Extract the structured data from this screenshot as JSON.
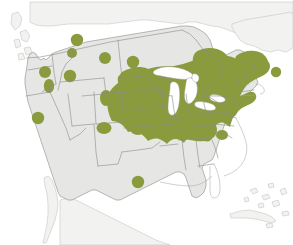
{
  "figure": {
    "kind": "species-range-map",
    "region": "North America",
    "title": "",
    "caption": "",
    "width": 293,
    "height": 245
  },
  "colors": {
    "background": "#ffffff",
    "range_green": "#8a9b3e",
    "land_us": "#e6e6e4",
    "land_other": "#ededeb",
    "land_faint": "#f2f2f0",
    "border_gray": "#8c8c8c",
    "coast_gray": "#a0a0a0",
    "lake_white": "#ffffff"
  },
  "legend": {
    "present": false,
    "items": []
  },
  "labels": {
    "present": false,
    "items": []
  },
  "chart_data": {
    "type": "map",
    "projection_note": "conic, continental United States with southern Canada, northern Mexico, Cuba and Bahamas",
    "title": "",
    "xlabel": "",
    "ylabel": "",
    "legend_position": "none",
    "grid": false,
    "series": [
      {
        "name": "Core contiguous range",
        "color": "#8a9b3e",
        "description": "Continuous shading across the Upper Midwest, Great Lakes states, Ohio Valley, Appalachians, Mid-Atlantic, New England and adjacent southeastern Canada",
        "regions": [
          "Minnesota (east)",
          "Wisconsin",
          "Michigan",
          "Iowa (northeast)",
          "Illinois (north)",
          "Indiana",
          "Ohio",
          "Kentucky (north)",
          "West Virginia",
          "Pennsylvania",
          "New York",
          "New Jersey",
          "Connecticut",
          "Rhode Island",
          "Massachusetts",
          "Vermont",
          "New Hampshire",
          "Maine",
          "Ontario (south)",
          "Quebec (south)",
          "New Brunswick",
          "Nova Scotia"
        ]
      },
      {
        "name": "Outlying occurrence dots",
        "color": "#8a9b3e",
        "description": "Isolated circular and elongated patches scattered across the western and southern United States",
        "points": [
          {
            "x": 77,
            "y": 40,
            "rx": 6.2,
            "ry": 6.2,
            "place": "south-central British Columbia / northern Washington"
          },
          {
            "x": 72,
            "y": 53,
            "rx": 5.0,
            "ry": 5.0,
            "place": "northern Idaho"
          },
          {
            "x": 105,
            "y": 58,
            "rx": 6.0,
            "ry": 6.0,
            "place": "north-central Montana"
          },
          {
            "x": 133,
            "y": 62,
            "rx": 6.2,
            "ry": 6.2,
            "place": "western North Dakota"
          },
          {
            "x": 45,
            "y": 72,
            "rx": 6.0,
            "ry": 6.0,
            "place": "central Washington"
          },
          {
            "x": 70,
            "y": 76,
            "rx": 6.2,
            "ry": 6.2,
            "place": "southwestern Montana"
          },
          {
            "x": 49,
            "y": 86,
            "rx": 5.2,
            "ry": 7.0,
            "place": "eastern Oregon"
          },
          {
            "x": 146,
            "y": 79,
            "rx": 5.4,
            "ry": 5.4,
            "place": "eastern North Dakota"
          },
          {
            "x": 106,
            "y": 98,
            "rx": 6.0,
            "ry": 8.0,
            "place": "eastern Wyoming / Black Hills"
          },
          {
            "x": 122,
            "y": 106,
            "rx": 5.4,
            "ry": 5.4,
            "place": "central Nebraska"
          },
          {
            "x": 145,
            "y": 102,
            "rx": 6.6,
            "ry": 7.5,
            "place": "eastern Nebraska"
          },
          {
            "x": 38,
            "y": 118,
            "rx": 6.2,
            "ry": 6.2,
            "place": "northern California / Sierra"
          },
          {
            "x": 104,
            "y": 128,
            "rx": 7.5,
            "ry": 6.0,
            "place": "western Kansas"
          },
          {
            "x": 138,
            "y": 129,
            "rx": 8.0,
            "ry": 6.0,
            "place": "eastern Kansas"
          },
          {
            "x": 138,
            "y": 182,
            "rx": 6.2,
            "ry": 6.2,
            "place": "north-central Texas"
          },
          {
            "x": 212,
            "y": 64,
            "rx": 6.0,
            "ry": 6.0,
            "place": "southern Ontario / Georgian Bay"
          },
          {
            "x": 247,
            "y": 58,
            "rx": 5.0,
            "ry": 5.0,
            "place": "southern Quebec"
          },
          {
            "x": 262,
            "y": 70,
            "rx": 5.0,
            "ry": 5.0,
            "place": "New Brunswick"
          },
          {
            "x": 276,
            "y": 72,
            "rx": 5.2,
            "ry": 5.2,
            "place": "Nova Scotia"
          },
          {
            "x": 223,
            "y": 110,
            "rx": 6.5,
            "ry": 5.5,
            "place": "Virginia piedmont"
          },
          {
            "x": 166,
            "y": 124,
            "rx": 6.5,
            "ry": 5.5,
            "place": "southern Missouri / Ozarks"
          },
          {
            "x": 196,
            "y": 123,
            "rx": 6.0,
            "ry": 5.5,
            "place": "Tennessee"
          },
          {
            "x": 207,
            "y": 136,
            "rx": 5.5,
            "ry": 5.5,
            "place": "western North Carolina"
          },
          {
            "x": 222,
            "y": 135,
            "rx": 6.0,
            "ry": 5.0,
            "place": "central North Carolina"
          }
        ]
      }
    ],
    "water_features": [
      "Lake Superior",
      "Lake Michigan",
      "Lake Huron",
      "Lake Erie",
      "Lake Ontario",
      "Gulf of Mexico",
      "Atlantic Ocean",
      "Pacific Ocean"
    ],
    "uncolored_regions": [
      "Florida",
      "Georgia",
      "South Carolina (coast)",
      "Alabama",
      "Mississippi",
      "Louisiana",
      "Texas (most)",
      "New Mexico",
      "Arizona",
      "Nevada",
      "Utah",
      "Colorado (west)",
      "Oklahoma",
      "California (south)",
      "Cuba",
      "Bahamas",
      "northern Mexico"
    ]
  }
}
